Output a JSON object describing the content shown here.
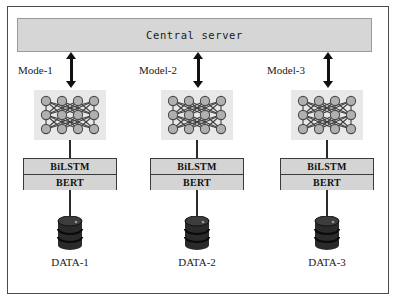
{
  "diagram": {
    "central_server": {
      "label": "Central server",
      "fill_color": "#d6d6d6",
      "border_color": "#9a9a9a"
    },
    "frame": {
      "border_color": "#4a4a4a",
      "background_color": "#ffffff"
    },
    "arrow_color": "#111111",
    "connector_color": "#2b2b2b",
    "neural_net": {
      "block_fill": "#e8e8e8",
      "node_fill": "#b0b0b0",
      "node_stroke": "#4a4a4a",
      "edge_color": "#3f3f3f",
      "layers": 3,
      "nodes_per_layer": 4
    },
    "model_box": {
      "fill_color": "#d4d4d4",
      "border_color": "#3a3a3a",
      "top_label": "BiLSTM",
      "bottom_label": "BERT"
    },
    "database": {
      "body_color": "#2a2a2a",
      "top_color": "#3d3d3d",
      "band_color": "#111111"
    },
    "columns": [
      {
        "model_label": "Mode-1",
        "stack_top": "BiLSTM",
        "stack_bottom": "BERT",
        "data_label": "DATA-1"
      },
      {
        "model_label": "Model-2",
        "stack_top": "BiLSTM",
        "stack_bottom": "BERT",
        "data_label": "DATA-2"
      },
      {
        "model_label": "Model-3",
        "stack_top": "BiLSTM",
        "stack_bottom": "BERT",
        "data_label": "DATA-3"
      }
    ]
  }
}
